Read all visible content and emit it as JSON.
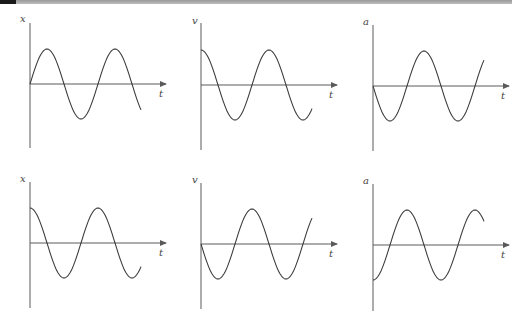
{
  "figure": {
    "rows": [
      {
        "panels": [
          {
            "y_label": "x",
            "x_label": "t",
            "curve": "sin",
            "sign": 1
          },
          {
            "y_label": "v",
            "x_label": "t",
            "curve": "cos",
            "sign": 1
          },
          {
            "y_label": "a",
            "x_label": "t",
            "curve": "sin",
            "sign": -1
          }
        ]
      },
      {
        "panels": [
          {
            "y_label": "x",
            "x_label": "t",
            "curve": "cos",
            "sign": 1
          },
          {
            "y_label": "v",
            "x_label": "t",
            "curve": "sin",
            "sign": -1
          },
          {
            "y_label": "a",
            "x_label": "t",
            "curve": "cos",
            "sign": -1
          }
        ]
      }
    ]
  },
  "colors": {
    "line": "#3c3c3c",
    "axis": "#5a5a5a",
    "background": "#ffffff"
  }
}
